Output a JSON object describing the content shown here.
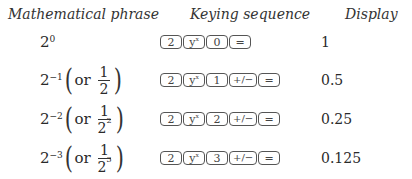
{
  "table": {
    "headers": {
      "phrase": "Mathematical phrase",
      "keys": "Keying sequence",
      "display": "Display"
    },
    "rows": [
      {
        "base": "2",
        "exp": "0",
        "alt": null,
        "keys": [
          "2",
          "y^x",
          "0",
          "="
        ],
        "display": "1"
      },
      {
        "base": "2",
        "exp": "−1",
        "alt": {
          "or": "or",
          "num": "1",
          "den_base": "2",
          "den_exp": ""
        },
        "keys": [
          "2",
          "y^x",
          "1",
          "+/−",
          "="
        ],
        "display": "0.5"
      },
      {
        "base": "2",
        "exp": "−2",
        "alt": {
          "or": "or",
          "num": "1",
          "den_base": "2",
          "den_exp": "2"
        },
        "keys": [
          "2",
          "y^x",
          "2",
          "+/−",
          "="
        ],
        "display": "0.25"
      },
      {
        "base": "2",
        "exp": "−3",
        "alt": {
          "or": "or",
          "num": "1",
          "den_base": "2",
          "den_exp": "3"
        },
        "keys": [
          "2",
          "y^x",
          "3",
          "+/−",
          "="
        ],
        "display": "0.125"
      }
    ],
    "key_labels": {
      "two": "2",
      "y": "y",
      "x": "x",
      "equals": "=",
      "neg": "+/−",
      "zero": "0",
      "one": "1",
      "three": "3"
    }
  }
}
